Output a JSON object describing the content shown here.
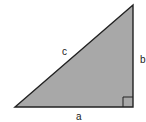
{
  "diagram": {
    "type": "right-triangle",
    "fill_color": "#a8a8a8",
    "stroke_color": "#222222",
    "vertices": {
      "left": [
        15,
        107
      ],
      "right_angle": [
        133,
        107
      ],
      "top": [
        133,
        5
      ]
    },
    "right_angle_marker_size": 10,
    "labels": {
      "hypotenuse": "c",
      "vertical_leg": "b",
      "horizontal_leg": "a"
    }
  }
}
